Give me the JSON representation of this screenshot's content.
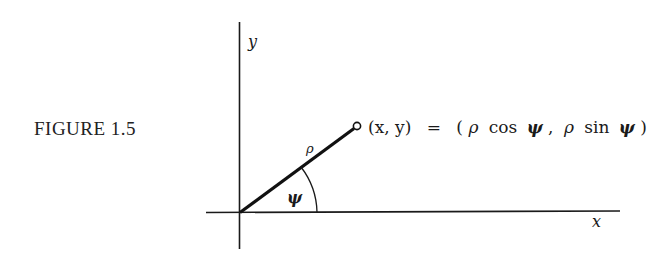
{
  "figure": {
    "label": "FIGURE 1.5"
  },
  "diagram": {
    "axes": {
      "x_label": "x",
      "y_label": "y"
    },
    "vector_label": "ρ",
    "angle_label": "ψ",
    "point_annotation": {
      "lhs": "(x, y)",
      "eq": "=",
      "rhs_open": "(",
      "rho1": "ρ",
      "cos": "cos",
      "psi1": "ψ",
      "comma": ",",
      "rho2": "ρ",
      "sin": "sin",
      "psi2": "ψ",
      "rhs_close": ")"
    },
    "colors": {
      "ink": "#1a1a1a",
      "background": "#ffffff"
    }
  }
}
